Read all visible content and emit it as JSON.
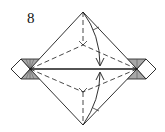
{
  "diagram": {
    "type": "origami-fold-step",
    "step_number": "8",
    "colors": {
      "paper_front": "#ffffff",
      "paper_back": "#a8a8a8",
      "line": "#1a1a1a"
    },
    "elements": [
      "rhombus-base-outline",
      "left-small-diamond-flap",
      "right-small-diamond-flap",
      "left-gray-trapezoid",
      "right-gray-trapezoid",
      "horizontal-center-line",
      "valley-fold-dashed-lines",
      "top-y-fold",
      "bottom-y-fold",
      "curved-fold-arrow-down",
      "curved-fold-arrow-up"
    ]
  }
}
